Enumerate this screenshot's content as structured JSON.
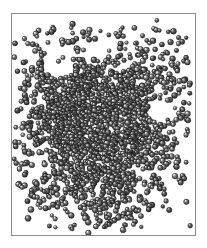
{
  "figure": {
    "title": "",
    "caption": "",
    "kind": "particle-aggregate-render",
    "background_color": "#ffffff",
    "frame": {
      "border_color": "#8d8d8d",
      "border_width_px": 1,
      "x": 11,
      "y": 13,
      "width": 185,
      "height": 223,
      "fill": "#ffffff"
    }
  },
  "render": {
    "particle_shape": "sphere",
    "particle_color_dark": "#2b2b2b",
    "particle_color_mid": "#7a7a7a",
    "particle_color_light": "#d8d8d8",
    "particle_highlight": "#f2f2f2",
    "particle_radius_px_min": 1.9,
    "particle_radius_px_max": 3.1,
    "light_direction": "upper-left",
    "particle_count": 1750,
    "seed": 20240517
  },
  "chart_data": {
    "type": "scatter",
    "title": "",
    "xlabel": "",
    "ylabel": "",
    "xlim": [
      0,
      185
    ],
    "ylim": [
      0,
      223
    ],
    "grid": false,
    "legend": null,
    "clusters": [
      {
        "name": "core-upper-left",
        "cx": 62,
        "cy": 78,
        "sx": 26,
        "sy": 24,
        "n": 300
      },
      {
        "name": "core-center",
        "cx": 92,
        "cy": 112,
        "sx": 30,
        "sy": 28,
        "n": 360
      },
      {
        "name": "core-left-mid",
        "cx": 52,
        "cy": 118,
        "sx": 22,
        "sy": 26,
        "n": 230
      },
      {
        "name": "core-lower",
        "cx": 98,
        "cy": 150,
        "sx": 26,
        "sy": 26,
        "n": 250
      },
      {
        "name": "arm-upper-right",
        "cx": 128,
        "cy": 62,
        "sx": 26,
        "sy": 22,
        "n": 180
      },
      {
        "name": "arm-right",
        "cx": 140,
        "cy": 118,
        "sx": 22,
        "sy": 26,
        "n": 120
      },
      {
        "name": "arm-lower-left",
        "cx": 58,
        "cy": 168,
        "sx": 24,
        "sy": 20,
        "n": 110
      },
      {
        "name": "arm-lower-center",
        "cx": 104,
        "cy": 186,
        "sx": 22,
        "sy": 18,
        "n": 90
      },
      {
        "name": "halo-diffuse",
        "cx": 92,
        "cy": 112,
        "sx": 56,
        "sy": 62,
        "n": 210
      }
    ],
    "voids": [
      {
        "name": "void-upper-left",
        "cx": 48,
        "cy": 52,
        "rx": 15,
        "ry": 13
      },
      {
        "name": "void-right-mid",
        "cx": 150,
        "cy": 98,
        "rx": 14,
        "ry": 12
      },
      {
        "name": "void-upper-center",
        "cx": 86,
        "cy": 38,
        "rx": 10,
        "ry": 8
      },
      {
        "name": "void-left-lower",
        "cx": 30,
        "cy": 150,
        "rx": 9,
        "ry": 9
      }
    ],
    "outliers": [
      {
        "x": 16,
        "y": 30
      },
      {
        "x": 24,
        "y": 20
      },
      {
        "x": 40,
        "y": 18
      },
      {
        "x": 60,
        "y": 14
      },
      {
        "x": 78,
        "y": 20
      },
      {
        "x": 110,
        "y": 16
      },
      {
        "x": 132,
        "y": 22
      },
      {
        "x": 158,
        "y": 18
      },
      {
        "x": 172,
        "y": 28
      },
      {
        "x": 176,
        "y": 44
      },
      {
        "x": 180,
        "y": 70
      },
      {
        "x": 172,
        "y": 96
      },
      {
        "x": 176,
        "y": 122
      },
      {
        "x": 168,
        "y": 148
      },
      {
        "x": 174,
        "y": 166
      },
      {
        "x": 150,
        "y": 176
      },
      {
        "x": 136,
        "y": 190
      },
      {
        "x": 118,
        "y": 202
      },
      {
        "x": 96,
        "y": 212
      },
      {
        "x": 74,
        "y": 206
      },
      {
        "x": 56,
        "y": 200
      },
      {
        "x": 34,
        "y": 196
      },
      {
        "x": 20,
        "y": 182
      },
      {
        "x": 14,
        "y": 160
      },
      {
        "x": 12,
        "y": 136
      },
      {
        "x": 16,
        "y": 110
      },
      {
        "x": 14,
        "y": 84
      },
      {
        "x": 20,
        "y": 62
      },
      {
        "x": 30,
        "y": 42
      },
      {
        "x": 50,
        "y": 190
      },
      {
        "x": 84,
        "y": 198
      },
      {
        "x": 160,
        "y": 134
      },
      {
        "x": 164,
        "y": 70
      }
    ]
  }
}
